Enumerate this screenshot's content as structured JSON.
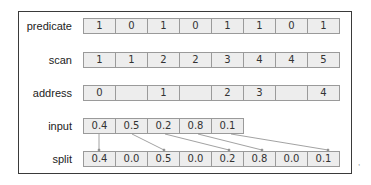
{
  "diagram": {
    "rows": [
      {
        "label": "predicate",
        "cells": [
          "1",
          "0",
          "1",
          "0",
          "1",
          "1",
          "0",
          "1"
        ]
      },
      {
        "label": "scan",
        "cells": [
          "1",
          "1",
          "2",
          "2",
          "3",
          "4",
          "4",
          "5"
        ]
      },
      {
        "label": "address",
        "cells": [
          "0",
          "",
          "1",
          "",
          "2",
          "3",
          "",
          "4"
        ]
      },
      {
        "label": "input",
        "cells": [
          "0.4",
          "0.5",
          "0.2",
          "0.8",
          "0.1"
        ]
      },
      {
        "label": "split",
        "cells": [
          "0.4",
          "0.0",
          "0.5",
          "0.0",
          "0.2",
          "0.8",
          "0.0",
          "0.1"
        ]
      }
    ],
    "arrows": [
      {
        "from_input_index": 0,
        "to_split_index": 0
      },
      {
        "from_input_index": 1,
        "to_split_index": 2
      },
      {
        "from_input_index": 2,
        "to_split_index": 4
      },
      {
        "from_input_index": 3,
        "to_split_index": 5
      },
      {
        "from_input_index": 4,
        "to_split_index": 7
      }
    ],
    "colors": {
      "cell_fill": "#ededed",
      "cell_border": "#9a9a9a",
      "frame": "#3a3a3a",
      "arrow": "#8a8a8a"
    }
  }
}
